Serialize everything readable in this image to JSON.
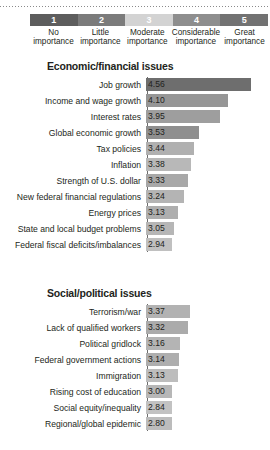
{
  "legend": {
    "blocks": [
      {
        "num": "1",
        "line1": "No",
        "line2": "importance",
        "color": "#5d5d5d"
      },
      {
        "num": "2",
        "line1": "Little",
        "line2": "importance",
        "color": "#7b7b7b"
      },
      {
        "num": "3",
        "line1": "Moderate",
        "line2": "importance",
        "color": "#d3d3d3"
      },
      {
        "num": "4",
        "line1": "Considerable",
        "line2": "importance",
        "color": "#8e8e8e"
      },
      {
        "num": "5",
        "line1": "Great",
        "line2": "importance",
        "color": "#727272"
      }
    ]
  },
  "chart_data": {
    "type": "bar",
    "title": "",
    "xlabel": "",
    "ylabel": "",
    "xlim": [
      2.5,
      4.75
    ],
    "grid": false,
    "legend_position": "top",
    "orientation": "horizontal",
    "scale_labels": [
      "No importance",
      "Little importance",
      "Moderate importance",
      "Considerable importance",
      "Great importance"
    ],
    "sections": [
      {
        "title": "Economic/financial issues",
        "categories": [
          "Job growth",
          "Income and wage growth",
          "Interest rates",
          "Global economic growth",
          "Tax policies",
          "Inflation",
          "Strength of U.S. dollar",
          "New federal financial regulations",
          "Energy prices",
          "State and local budget problems",
          "Federal fiscal deficits/imbalances"
        ],
        "values": [
          4.56,
          4.1,
          3.95,
          3.53,
          3.44,
          3.38,
          3.33,
          3.24,
          3.13,
          3.05,
          2.94
        ],
        "value_labels": [
          "4.56",
          "4.10",
          "3.95",
          "3.53",
          "3.44",
          "3.38",
          "3.33",
          "3.24",
          "3.13",
          "3.05",
          "2.94"
        ],
        "colors": [
          "#6e6e6e",
          "#969696",
          "#9e9e9e",
          "#8f8f8f",
          "#b0b0b0",
          "#b8b8b8",
          "#a8a8a8",
          "#b4b4b4",
          "#aeaeae",
          "#b6b6b6",
          "#c0c0c0"
        ]
      },
      {
        "title": "Social/political issues",
        "categories": [
          "Terrorism/war",
          "Lack of qualified workers",
          "Political gridlock",
          "Federal government actions",
          "Immigration",
          "Rising cost of education",
          "Social equity/inequality",
          "Regional/global epidemic"
        ],
        "values": [
          3.37,
          3.32,
          3.16,
          3.14,
          3.13,
          3.0,
          2.84,
          2.8
        ],
        "value_labels": [
          "3.37",
          "3.32",
          "3.16",
          "3.14",
          "3.13",
          "3.00",
          "2.84",
          "2.80"
        ],
        "colors": [
          "#b2b2b2",
          "#ababab",
          "#b4b4b4",
          "#aeaeae",
          "#bdbdbd",
          "#b7b7b7",
          "#c2c2c2",
          "#bcbcbc"
        ]
      }
    ]
  }
}
